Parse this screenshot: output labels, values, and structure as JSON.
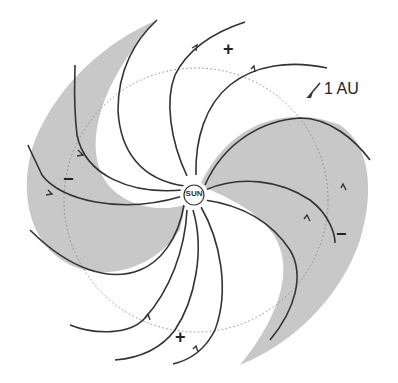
{
  "diagram": {
    "title": "",
    "center_label": "SUN",
    "orbit_label": "1 AU",
    "polarity_labels": [
      {
        "sign": "+",
        "position": "top"
      },
      {
        "sign": "+",
        "position": "bottom"
      },
      {
        "sign": "−",
        "position": "left"
      },
      {
        "sign": "−",
        "position": "right"
      }
    ],
    "colors": {
      "sector_fill": "#c8c8c8",
      "field_line": "#333333",
      "orbit_line": "#888888",
      "background": "#ffffff"
    }
  }
}
